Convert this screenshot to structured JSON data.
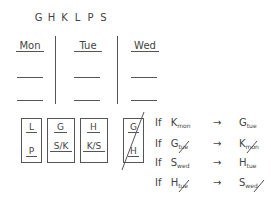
{
  "letters": [
    "G",
    "H",
    "K",
    "L",
    "P",
    "S"
  ],
  "days": [
    "Mon",
    "Tue",
    "Wed"
  ],
  "boxes": [
    {
      "top": "L",
      "bottom": "P"
    },
    {
      "top": "G",
      "bottom": "S/K"
    },
    {
      "top": "H",
      "bottom": "K/S"
    },
    {
      "top": "G",
      "bottom": "H",
      "crossed": true
    }
  ],
  "rules": [
    {
      "if": "If",
      "lhs": "K",
      "lhs_sub": "mon",
      "arrow": "→",
      "rhs": "G",
      "rhs_sub": "tue"
    },
    {
      "if": "If",
      "lhs": "G",
      "lhs_sub": "tue",
      "lhs_struck": true,
      "arrow": "→",
      "rhs": "K",
      "rhs_sub": "mon",
      "rhs_struck": true
    },
    {
      "if": "If",
      "lhs": "S",
      "lhs_sub": "wed",
      "arrow": "→",
      "rhs": "H",
      "rhs_sub": "tue"
    },
    {
      "if": "If",
      "lhs": "H",
      "lhs_sub": "tue",
      "lhs_struck": true,
      "arrow": "→",
      "rhs": "S",
      "rhs_sub": "wed",
      "rhs_struck": true
    }
  ]
}
